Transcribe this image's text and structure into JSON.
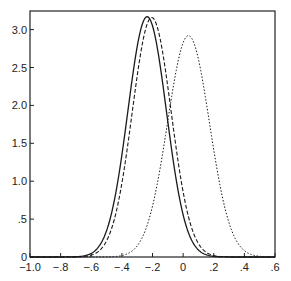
{
  "chart_data": {
    "type": "line",
    "title": "",
    "xlabel": "",
    "ylabel": "",
    "xlim": [
      -1.0,
      0.6
    ],
    "ylim": [
      0,
      3.2
    ],
    "grid": false,
    "legend": null,
    "x_ticks": [
      -1.0,
      -0.8,
      -0.6,
      -0.4,
      -0.2,
      0,
      0.2,
      0.4,
      0.6
    ],
    "x_tick_labels": [
      "-1.0",
      "-.8",
      "-.6",
      "-.4",
      "-.2",
      "0",
      ".2",
      ".4",
      ".6"
    ],
    "y_ticks": [
      0,
      0.5,
      1.0,
      1.5,
      2.0,
      2.5,
      3.0
    ],
    "y_tick_labels": [
      "0",
      ".5",
      "1.0",
      "1.5",
      "2.0",
      "2.5",
      "3.0"
    ],
    "series": [
      {
        "name": "solid",
        "style": "solid",
        "shape": "gaussian",
        "mean": -0.235,
        "sd": 0.126,
        "peak": 3.17,
        "x": [
          -0.6,
          -0.5,
          -0.4,
          -0.3,
          -0.235,
          -0.2,
          -0.1,
          0.0,
          0.1,
          0.2
        ],
        "values": [
          0.05,
          0.34,
          1.33,
          2.79,
          3.17,
          3.07,
          1.76,
          0.55,
          0.09,
          0.01
        ]
      },
      {
        "name": "dashed",
        "style": "dashed",
        "shape": "gaussian",
        "mean": -0.205,
        "sd": 0.127,
        "peak": 3.16,
        "x": [
          -0.6,
          -0.5,
          -0.4,
          -0.3,
          -0.205,
          -0.1,
          0.0,
          0.1,
          0.2
        ],
        "values": [
          0.02,
          0.23,
          1.0,
          2.39,
          3.16,
          2.41,
          0.86,
          0.15,
          0.01
        ]
      },
      {
        "name": "dotted",
        "style": "dotted",
        "shape": "gaussian",
        "mean": 0.035,
        "sd": 0.137,
        "peak": 2.92,
        "x": [
          -0.4,
          -0.3,
          -0.2,
          -0.1,
          0.0,
          0.035,
          0.1,
          0.2,
          0.3,
          0.4,
          0.5
        ],
        "values": [
          0.02,
          0.16,
          0.67,
          1.8,
          2.82,
          2.92,
          2.6,
          1.53,
          0.56,
          0.09,
          0.01
        ]
      }
    ]
  },
  "colors": {
    "axis": "#222222",
    "line": "#1a1a1a",
    "background": "#ffffff"
  }
}
